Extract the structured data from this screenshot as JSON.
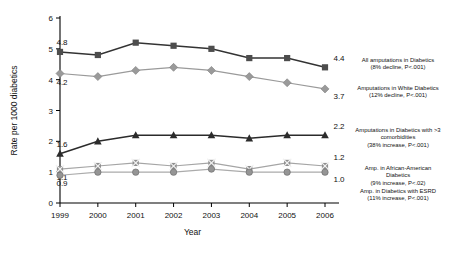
{
  "chart_data": {
    "type": "line",
    "title": "",
    "xlabel": "Year",
    "ylabel": "Rate per 1000 diabetics",
    "categories": [
      "1999",
      "2000",
      "2001",
      "2002",
      "2003",
      "2004",
      "2005",
      "2006"
    ],
    "x": [
      1999,
      2000,
      2001,
      2002,
      2003,
      2004,
      2005,
      2006
    ],
    "ylim": [
      0,
      6
    ],
    "yticks": [
      0,
      1,
      2,
      3,
      4,
      5,
      6
    ],
    "ytick_labels": [
      "0",
      "1",
      "2",
      "3",
      "4",
      "5",
      "6"
    ],
    "grid": false,
    "legend_position": "right",
    "series": [
      {
        "name": "All amputations in Diabetics",
        "marker": "square",
        "color": "#4d4d4d",
        "line_color": "#333333",
        "values": [
          4.9,
          4.8,
          5.2,
          5.1,
          5.0,
          4.7,
          4.7,
          4.4
        ],
        "start_label": "4.8",
        "end_label": "4.4",
        "legend_line1": "All amputations in Diabetics",
        "legend_line2": "(8% decline, P<.001)"
      },
      {
        "name": "Amputations in White Diabetics",
        "marker": "diamond",
        "color": "#9a9a9a",
        "line_color": "#9a9a9a",
        "values": [
          4.2,
          4.1,
          4.3,
          4.4,
          4.3,
          4.1,
          3.9,
          3.7
        ],
        "start_label": "4.2",
        "end_label": "3.7",
        "legend_line1": "Amputations in White Diabetics",
        "legend_line2": "(12% decline, P<.001)"
      },
      {
        "name": "Amputations in Diabetics with >3 comorbidities",
        "marker": "triangle",
        "color": "#2b2b2b",
        "line_color": "#2b2b2b",
        "values": [
          1.6,
          2.0,
          2.2,
          2.2,
          2.2,
          2.1,
          2.2,
          2.2
        ],
        "start_label": "1.6",
        "end_label": "2.2",
        "legend_line1": "Amputations in Diabetics with >3",
        "legend_line2": "comorbidities",
        "legend_line3": "(38% increase, P<.001)"
      },
      {
        "name": "Amp. in African-American Diabetics",
        "marker": "cross",
        "color": "#8f8f8f",
        "line_color": "#a5a5a5",
        "values": [
          1.1,
          1.2,
          1.3,
          1.2,
          1.3,
          1.1,
          1.3,
          1.2
        ],
        "start_label": "1.1",
        "end_label": "1.2",
        "legend_line1": "Amp. in African-American",
        "legend_line2": "Diabetics",
        "legend_line3": "(9% increase, P<.02)"
      },
      {
        "name": "Amp. in Diabetics with ESRD",
        "marker": "circle",
        "color": "#959595",
        "line_color": "#ababab",
        "values": [
          0.9,
          1.0,
          1.0,
          1.0,
          1.1,
          1.0,
          1.0,
          1.0
        ],
        "start_label": "0.9",
        "end_label": "1.0",
        "legend_line1": "Amp. in Diabetics with ESRD",
        "legend_line2": "(11% increase, P<.001)"
      }
    ]
  }
}
